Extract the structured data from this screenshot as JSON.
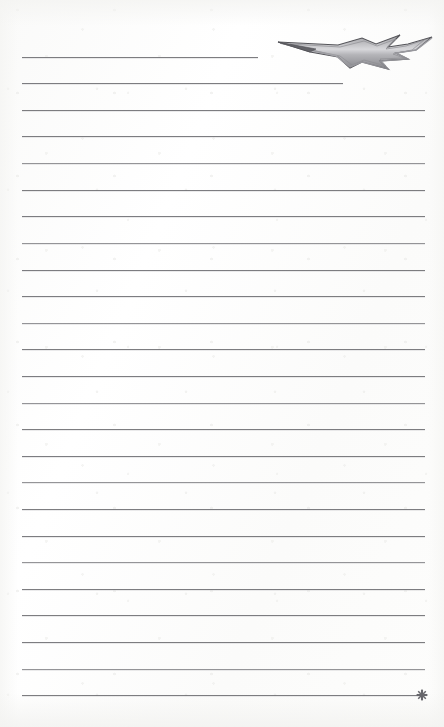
{
  "page": {
    "width": 444,
    "height": 727,
    "kind": "lined-notepad-page",
    "background_color": "#fdfdfc",
    "paper_tone": "#ffffff"
  },
  "decorations": {
    "lightning_bolt": {
      "icon": "lightning-bolt-icon",
      "x": 276,
      "y": 28,
      "width": 158,
      "height": 46,
      "stroke_color": "#5a5a5e",
      "fill_color": "#8e8e92"
    },
    "end_asterisk": {
      "icon": "asterisk-icon",
      "x": 416,
      "y": 687,
      "size": 12,
      "color": "#6b6b70"
    }
  },
  "ruled_lines": {
    "count": 25,
    "left": 22,
    "right": 425,
    "first_y": 57,
    "spacing": 26.6,
    "color": "#68686c",
    "lines": [
      {
        "index": 1,
        "y": 57,
        "x1": 22,
        "x2": 258,
        "weight": "normal"
      },
      {
        "index": 2,
        "y": 83,
        "x1": 22,
        "x2": 343,
        "weight": "normal"
      },
      {
        "index": 3,
        "y": 110,
        "x1": 22,
        "x2": 425,
        "weight": "normal"
      },
      {
        "index": 4,
        "y": 136,
        "x1": 22,
        "x2": 425,
        "weight": "normal"
      },
      {
        "index": 5,
        "y": 163,
        "x1": 22,
        "x2": 425,
        "weight": "soft"
      },
      {
        "index": 6,
        "y": 190,
        "x1": 22,
        "x2": 425,
        "weight": "normal"
      },
      {
        "index": 7,
        "y": 216,
        "x1": 22,
        "x2": 425,
        "weight": "normal"
      },
      {
        "index": 8,
        "y": 243,
        "x1": 22,
        "x2": 425,
        "weight": "soft"
      },
      {
        "index": 9,
        "y": 270,
        "x1": 22,
        "x2": 425,
        "weight": "normal"
      },
      {
        "index": 10,
        "y": 296,
        "x1": 22,
        "x2": 425,
        "weight": "normal"
      },
      {
        "index": 11,
        "y": 323,
        "x1": 22,
        "x2": 425,
        "weight": "soft"
      },
      {
        "index": 12,
        "y": 349,
        "x1": 22,
        "x2": 425,
        "weight": "normal"
      },
      {
        "index": 13,
        "y": 376,
        "x1": 22,
        "x2": 425,
        "weight": "normal"
      },
      {
        "index": 14,
        "y": 403,
        "x1": 22,
        "x2": 425,
        "weight": "soft"
      },
      {
        "index": 15,
        "y": 429,
        "x1": 22,
        "x2": 425,
        "weight": "normal"
      },
      {
        "index": 16,
        "y": 456,
        "x1": 22,
        "x2": 425,
        "weight": "normal"
      },
      {
        "index": 17,
        "y": 482,
        "x1": 22,
        "x2": 425,
        "weight": "soft"
      },
      {
        "index": 18,
        "y": 509,
        "x1": 22,
        "x2": 425,
        "weight": "normal"
      },
      {
        "index": 19,
        "y": 536,
        "x1": 22,
        "x2": 425,
        "weight": "normal"
      },
      {
        "index": 20,
        "y": 562,
        "x1": 22,
        "x2": 425,
        "weight": "soft"
      },
      {
        "index": 21,
        "y": 589,
        "x1": 22,
        "x2": 425,
        "weight": "normal"
      },
      {
        "index": 22,
        "y": 615,
        "x1": 22,
        "x2": 425,
        "weight": "normal"
      },
      {
        "index": 23,
        "y": 642,
        "x1": 22,
        "x2": 425,
        "weight": "normal"
      },
      {
        "index": 24,
        "y": 669,
        "x1": 22,
        "x2": 425,
        "weight": "soft"
      },
      {
        "index": 25,
        "y": 695,
        "x1": 22,
        "x2": 420,
        "weight": "normal"
      }
    ]
  },
  "writing_area": {
    "label": "",
    "placeholder": ""
  }
}
